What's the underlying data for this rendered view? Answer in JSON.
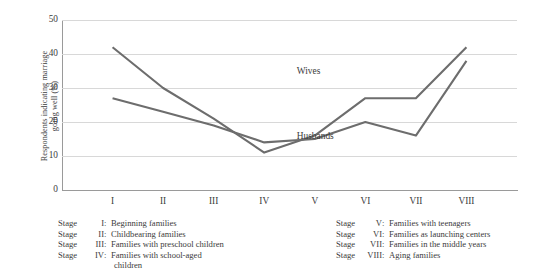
{
  "chart_data": {
    "type": "line",
    "title": "",
    "xlabel": "",
    "ylabel": "Respondents indicating marriage\ngoing well (%)",
    "ylim": [
      0,
      50
    ],
    "ytick_labels": [
      "0",
      "10",
      "20",
      "30",
      "40",
      "50"
    ],
    "ytick_values": [
      0,
      10,
      20,
      30,
      40,
      50
    ],
    "grid": true,
    "grid_axis": "y",
    "legend_position": "inline-annotations",
    "categories": [
      "I",
      "II",
      "III",
      "IV",
      "V",
      "VI",
      "VII",
      "VIII"
    ],
    "x_values": [
      1,
      2,
      3,
      4,
      5,
      6,
      7,
      8
    ],
    "series": [
      {
        "name": "Wives",
        "color": "#6d6d6d",
        "values": [
          42,
          30,
          21,
          11,
          16,
          27,
          27,
          42
        ],
        "label_x": 5,
        "label_y": 35
      },
      {
        "name": "Husbands",
        "color": "#6d6d6d",
        "values": [
          27,
          23,
          19,
          14,
          15,
          20,
          16,
          38
        ],
        "label_x": 5,
        "label_y": 16
      }
    ],
    "annotations": [
      {
        "text": "Wives",
        "name": "wives-series-label"
      },
      {
        "text": "Husbands",
        "name": "husbands-series-label"
      }
    ],
    "colors": {
      "line": "#6d6d6d",
      "gridline": "#d8d8d8",
      "axis": "#9a9a9a",
      "text": "#3b3b3b",
      "background": "#ffffff"
    }
  },
  "legend": {
    "stage_word": "Stage",
    "columns": [
      {
        "name": "legend-column-left",
        "entries": [
          {
            "roman": "I",
            "colon": ":",
            "description": "Beginning families"
          },
          {
            "roman": "II",
            "colon": ":",
            "description": "Childbearing families"
          },
          {
            "roman": "III",
            "colon": ":",
            "description": "Families with preschool children"
          },
          {
            "roman": "IV",
            "colon": ":",
            "description": "Families with school-aged",
            "continuation": "children"
          }
        ]
      },
      {
        "name": "legend-column-right",
        "entries": [
          {
            "roman": "V",
            "colon": ":",
            "description": "Families with teenagers"
          },
          {
            "roman": "VI",
            "colon": ":",
            "description": "Families as launching centers"
          },
          {
            "roman": "VII",
            "colon": ":",
            "description": "Families in the middle years"
          },
          {
            "roman": "VIII",
            "colon": ":",
            "description": "Aging families"
          }
        ]
      }
    ]
  }
}
